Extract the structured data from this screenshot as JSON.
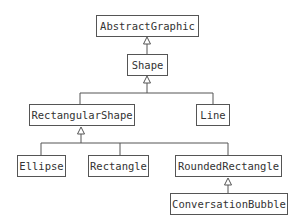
{
  "diagram": {
    "type": "class-hierarchy",
    "nodes": {
      "abstract_graphic": "AbstractGraphic",
      "shape": "Shape",
      "rectangular_shape": "RectangularShape",
      "line": "Line",
      "ellipse": "Ellipse",
      "rectangle": "Rectangle",
      "rounded_rectangle": "RoundedRectangle",
      "conversation_bubble": "ConversationBubble"
    },
    "edges": [
      {
        "from": "Shape",
        "to": "AbstractGraphic",
        "kind": "inheritance"
      },
      {
        "from": "RectangularShape",
        "to": "Shape",
        "kind": "inheritance"
      },
      {
        "from": "Line",
        "to": "Shape",
        "kind": "inheritance"
      },
      {
        "from": "Ellipse",
        "to": "RectangularShape",
        "kind": "inheritance"
      },
      {
        "from": "Rectangle",
        "to": "RectangularShape",
        "kind": "inheritance"
      },
      {
        "from": "RoundedRectangle",
        "to": "RectangularShape",
        "kind": "inheritance"
      },
      {
        "from": "ConversationBubble",
        "to": "RoundedRectangle",
        "kind": "inheritance"
      }
    ]
  }
}
